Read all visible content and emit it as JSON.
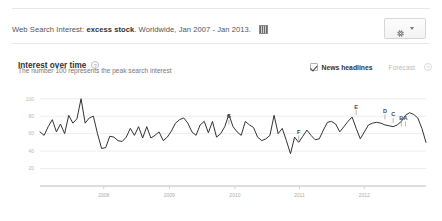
{
  "header": {
    "prefix": "Web Search Interest:",
    "query": "excess stock",
    "scope": ". Worldwide, Jan 2007 - Jan 2013.",
    "embed_icon": "embed-code-icon",
    "settings_icon": "gear-icon",
    "settings_caret": "chevron-down-icon"
  },
  "section": {
    "title": "Interest over time",
    "help": "?",
    "subtitle": "The number 100 represents the peak search interest"
  },
  "controls": {
    "news_headlines": {
      "label": "News headlines",
      "checked": true
    },
    "forecast": {
      "label": "Forecast",
      "help": "?",
      "checked": false
    }
  },
  "chart_data": {
    "type": "line",
    "title": "Interest over time",
    "xlabel": "",
    "ylabel": "",
    "ylim": [
      0,
      110
    ],
    "yticks": [
      100,
      80,
      60,
      40,
      20
    ],
    "grid": true,
    "legend": "none",
    "xticks": [
      "2008",
      "2009",
      "2010",
      "2011",
      "2012"
    ],
    "xtick_positions": [
      0.165,
      0.335,
      0.505,
      0.672,
      0.84
    ],
    "x_range": [
      "Jan 2007",
      "Jan 2013"
    ],
    "series": [
      {
        "name": "excess stock",
        "color": "#333333",
        "values": [
          62,
          58,
          68,
          76,
          62,
          71,
          60,
          81,
          72,
          77,
          100,
          72,
          78,
          80,
          60,
          43,
          44,
          57,
          56,
          52,
          51,
          56,
          66,
          58,
          68,
          55,
          68,
          55,
          58,
          62,
          52,
          56,
          63,
          72,
          76,
          78,
          72,
          62,
          58,
          70,
          74,
          61,
          74,
          56,
          60,
          68,
          82,
          68,
          62,
          58,
          74,
          70,
          67,
          56,
          52,
          54,
          58,
          81,
          60,
          66,
          52,
          37,
          56,
          50,
          57,
          64,
          58,
          53,
          54,
          64,
          73,
          74,
          71,
          62,
          68,
          74,
          79,
          66,
          54,
          62,
          70,
          72,
          73,
          72,
          70,
          69,
          68,
          70,
          74,
          81,
          84,
          82,
          78,
          66,
          50
        ]
      }
    ],
    "annotations": [
      {
        "label": "G",
        "x_index": 46,
        "value": 68,
        "name": "news-marker-g"
      },
      {
        "label": "F",
        "x_index": 63,
        "value": 50,
        "name": "news-marker-f"
      },
      {
        "label": "E",
        "x_index": 77,
        "value": 79,
        "name": "news-marker-e"
      },
      {
        "label": "D",
        "x_index": 84,
        "value": 74,
        "name": "news-marker-d"
      },
      {
        "label": "C",
        "x_index": 86,
        "value": 70,
        "name": "news-marker-c"
      },
      {
        "label": "B",
        "x_index": 88,
        "value": 66,
        "name": "news-marker-b"
      },
      {
        "label": "A",
        "x_index": 89,
        "value": 66,
        "name": "news-marker-a"
      }
    ]
  }
}
